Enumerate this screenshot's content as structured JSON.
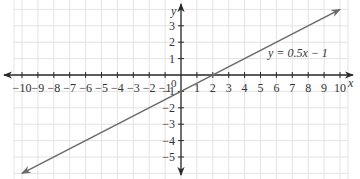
{
  "chart_data": {
    "type": "line",
    "title": "",
    "xlabel": "x",
    "ylabel": "y",
    "xlim": [
      -10,
      10
    ],
    "ylim": [
      -5,
      3
    ],
    "grid": true,
    "x_ticks": [
      -10,
      -9,
      -8,
      -7,
      -6,
      -5,
      -4,
      -3,
      -2,
      -1,
      1,
      2,
      3,
      4,
      5,
      6,
      7,
      8,
      9,
      10
    ],
    "y_ticks": [
      3,
      2,
      1,
      -1,
      -2,
      -3,
      -4,
      -5
    ],
    "origin_label": "0",
    "series": [
      {
        "name": "y = 0.5x − 1",
        "equation": "y = 0.5x − 1",
        "slope": 0.5,
        "intercept": -1,
        "x": [
          -10,
          10
        ],
        "y": [
          -6,
          4
        ],
        "color": "#6b6b6b"
      }
    ],
    "annotations": [
      {
        "text": "y = 0.5x − 1",
        "x": 6.5,
        "y": 1.8
      }
    ]
  },
  "colors": {
    "grid": "#e3e3e3",
    "axis": "#2a2a2a",
    "line": "#6b6b6b"
  }
}
